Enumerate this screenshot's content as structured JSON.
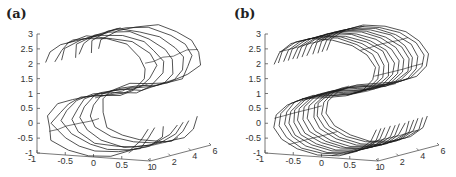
{
  "chart_data": [
    {
      "type": "line3d",
      "panel_label": "(a)",
      "title": "",
      "description": "3D S-curve manifold drawn as a sparse wireframe of noisy strands",
      "zlabel": "",
      "xlabel": "",
      "ylabel": "",
      "z_ticks": [
        "3",
        "2.5",
        "2",
        "1.5",
        "1",
        "0.5",
        "0",
        "-0.5",
        "-1"
      ],
      "x_ticks": [
        "-1",
        "-0.5",
        "0",
        "0.5",
        "1"
      ],
      "y_ticks": [
        "0",
        "2",
        "4",
        "6"
      ],
      "zlim": [
        -1,
        3
      ],
      "xlim": [
        -1,
        1
      ],
      "ylim": [
        0,
        6
      ],
      "strands": 7,
      "noise": 0.9,
      "grid": false
    },
    {
      "type": "line3d",
      "panel_label": "(b)",
      "title": "",
      "description": "3D S-curve manifold drawn as a dense, regular wireframe of strands",
      "zlabel": "",
      "xlabel": "",
      "ylabel": "",
      "z_ticks": [
        "3",
        "2.5",
        "2",
        "1.5",
        "1",
        "0.5",
        "0",
        "-0.5",
        "-1"
      ],
      "x_ticks": [
        "-1",
        "-0.5",
        "0",
        "0.5",
        "1"
      ],
      "y_ticks": [
        "0",
        "2",
        "4",
        "6"
      ],
      "zlim": [
        -1,
        3
      ],
      "xlim": [
        -1,
        1
      ],
      "ylim": [
        0,
        6
      ],
      "strands": 12,
      "noise": 0.25,
      "grid": false
    }
  ]
}
